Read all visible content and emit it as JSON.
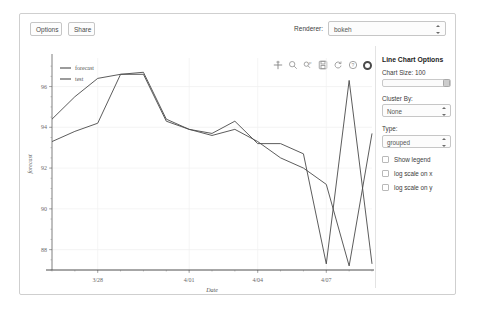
{
  "toolbar": {
    "options_label": "Options",
    "share_label": "Share",
    "renderer_label": "Renderer:",
    "renderer_value": "bokeh"
  },
  "plot_tools": [
    {
      "name": "pan-tool-icon"
    },
    {
      "name": "box-zoom-tool-icon"
    },
    {
      "name": "wheel-zoom-tool-icon"
    },
    {
      "name": "save-tool-icon"
    },
    {
      "name": "reset-tool-icon"
    },
    {
      "name": "help-tool-icon"
    },
    {
      "name": "bokeh-logo-icon"
    }
  ],
  "panel": {
    "title": "Line Chart Options",
    "chart_size_label": "Chart Size: 100",
    "chart_size_value": 100,
    "cluster_by_label": "Cluster By:",
    "cluster_by_value": "None",
    "type_label": "Type:",
    "type_value": "grouped",
    "checkboxes": [
      {
        "label": "Show legend",
        "checked": false
      },
      {
        "label": "log scale on x",
        "checked": false
      },
      {
        "label": "log scale on y",
        "checked": false
      }
    ]
  },
  "chart_data": {
    "type": "line",
    "title": "",
    "xlabel": "Date",
    "ylabel": "forecast",
    "xtick_labels": [
      "3/28",
      "4/01",
      "4/04",
      "4/07"
    ],
    "ytick_labels": [
      "96",
      "94",
      "92",
      "90",
      "88"
    ],
    "ylim": [
      87.0,
      97.4
    ],
    "grid": true,
    "legend": [
      "forecast",
      "test"
    ],
    "legend_position": "top-left",
    "line_color": "#4a4a4a",
    "series": [
      {
        "name": "forecast",
        "x": [
          "3/26",
          "3/27",
          "3/28",
          "3/29",
          "3/30",
          "3/31",
          "4/01",
          "4/02",
          "4/03",
          "4/04",
          "4/05",
          "4/06",
          "4/07",
          "4/08",
          "4/09"
        ],
        "values": [
          93.3,
          93.8,
          94.2,
          96.6,
          96.6,
          94.3,
          93.9,
          93.7,
          94.3,
          93.2,
          93.2,
          92.7,
          87.3,
          96.3,
          87.3
        ]
      },
      {
        "name": "test",
        "x": [
          "3/26",
          "3/27",
          "3/28",
          "3/29",
          "3/30",
          "3/31",
          "4/01",
          "4/02",
          "4/03",
          "4/04",
          "4/05",
          "4/06",
          "4/07",
          "4/08",
          "4/09"
        ],
        "values": [
          94.4,
          95.5,
          96.4,
          96.6,
          96.7,
          94.4,
          93.9,
          93.6,
          93.9,
          93.3,
          92.5,
          92.0,
          91.2,
          87.2,
          93.7
        ]
      }
    ]
  }
}
